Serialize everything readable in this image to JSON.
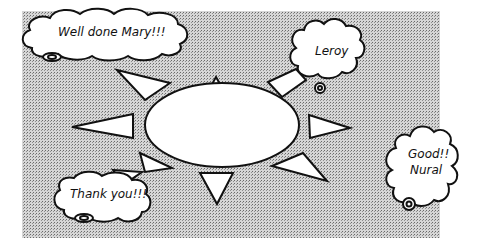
{
  "diagram": {
    "type": "sun-praise-diagram",
    "background_color": "#bdbdbd",
    "center_label": "",
    "rays": 8,
    "bubbles": [
      {
        "id": "mary",
        "text_lines": [
          "Well done Mary!!!"
        ]
      },
      {
        "id": "leroy",
        "text_lines": [
          "Leroy"
        ]
      },
      {
        "id": "nural",
        "text_lines": [
          "Good!!",
          "Nural"
        ]
      },
      {
        "id": "thanks",
        "text_lines": [
          "Thank you!!!"
        ]
      }
    ]
  }
}
